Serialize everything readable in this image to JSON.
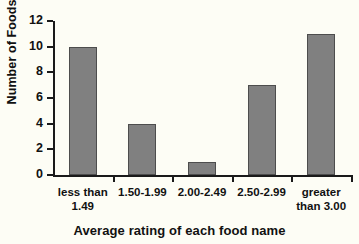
{
  "chart_data": {
    "type": "bar",
    "title": "",
    "categories": [
      "less than 1.49",
      "1.50-1.99",
      "2.00-2.49",
      "2.50-2.99",
      "greater than 3.00"
    ],
    "category_lines": [
      [
        "less than",
        "1.49"
      ],
      [
        "1.50-1.99",
        ""
      ],
      [
        "2.00-2.49",
        ""
      ],
      [
        "2.50-2.99",
        ""
      ],
      [
        "greater",
        "than 3.00"
      ]
    ],
    "values": [
      10,
      4,
      1,
      7,
      11
    ],
    "xlabel": "Average rating of each food name",
    "ylabel": "Number of Foods",
    "ylim": [
      0,
      12
    ],
    "yticks": [
      0,
      2,
      4,
      6,
      8,
      10,
      12
    ],
    "ytick_labels": [
      "0",
      "2",
      "4",
      "6",
      "8",
      "10",
      "12"
    ],
    "grid": false,
    "legend": false,
    "bar_color": "#808080",
    "bar_border_color": "#4d4d4d",
    "axis_color": "#1a1a1a",
    "background_color": "#fdfdf5"
  }
}
